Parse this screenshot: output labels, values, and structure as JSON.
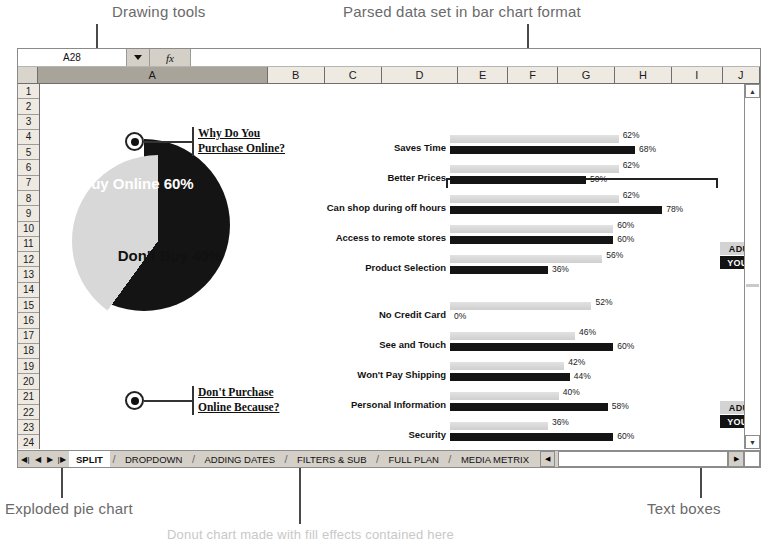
{
  "annotations": {
    "drawing_tools": "Drawing tools",
    "parsed_data": "Parsed data set in bar chart format",
    "exploded_pie": "Exploded pie chart",
    "text_boxes": "Text boxes",
    "bottom_caption": "Donut chart made with fill effects contained here"
  },
  "formula_bar": {
    "name_box_value": "A28",
    "dropdown_icon": "chevron-down-icon",
    "fx_label": "fx",
    "formula_value": ""
  },
  "columns": [
    "A",
    "B",
    "C",
    "D",
    "E",
    "F",
    "G",
    "H",
    "I",
    "J"
  ],
  "selected_column": "A",
  "rows": [
    "1",
    "2",
    "3",
    "4",
    "5",
    "6",
    "7",
    "8",
    "9",
    "10",
    "11",
    "12",
    "13",
    "14",
    "15",
    "16",
    "17",
    "18",
    "19",
    "20",
    "21",
    "22",
    "23",
    "24"
  ],
  "pie": {
    "slices": [
      {
        "label": "Buy Online",
        "value": "60%",
        "pct": 60,
        "color": "#141414",
        "exploded": true
      },
      {
        "label": "Don't Buy",
        "value": "40%",
        "pct": 40,
        "color": "#d8d8d8",
        "exploded": false
      }
    ]
  },
  "callouts": [
    {
      "line1": "Why Do You",
      "line2": "Purchase Online?"
    },
    {
      "line1": "Don't Purchase",
      "line2": "Online Because?"
    }
  ],
  "legend": [
    {
      "label": "ADULT",
      "color": "#d3d3d3"
    },
    {
      "label": "YOUNG",
      "color": "#131313"
    }
  ],
  "chart_data": {
    "type": "bar",
    "title": "",
    "orientation": "horizontal",
    "xlabel": "",
    "ylabel": "",
    "xlim": [
      0,
      100
    ],
    "grid": false,
    "legend_position": "right",
    "groups": [
      {
        "name": "Why Do You Purchase Online?",
        "categories": [
          "Saves Time",
          "Better Prices",
          "Can shop during off hours",
          "Access to remote stores",
          "Product Selection"
        ],
        "series": [
          {
            "name": "ADULT",
            "color": "#d3d3d3",
            "values": [
              62,
              62,
              62,
              60,
              56
            ]
          },
          {
            "name": "YOUNG",
            "color": "#131313",
            "values": [
              68,
              50,
              78,
              60,
              36
            ]
          }
        ]
      },
      {
        "name": "Don't Purchase Online Because?",
        "categories": [
          "No Credit Card",
          "See and Touch",
          "Won't Pay Shipping",
          "Personal Information",
          "Security"
        ],
        "series": [
          {
            "name": "ADULT",
            "color": "#d3d3d3",
            "values": [
              52,
              46,
              42,
              40,
              36
            ]
          },
          {
            "name": "YOUNG",
            "color": "#131313",
            "values": [
              0,
              60,
              44,
              58,
              60
            ]
          }
        ]
      }
    ],
    "labels": {
      "Saves Time": {
        "adult": "62%",
        "young": "68%"
      },
      "Better Prices": {
        "adult": "62%",
        "young": "50%"
      },
      "Can shop during off hours": {
        "adult": "62%",
        "young": "78%"
      },
      "Access to remote stores": {
        "adult": "60%",
        "young": "60%"
      },
      "Product Selection": {
        "adult": "56%",
        "young": "36%"
      },
      "No Credit Card": {
        "adult": "52%",
        "young": "0%"
      },
      "See and Touch": {
        "adult": "46%",
        "young": "60%"
      },
      "Won't Pay Shipping": {
        "adult": "42%",
        "young": "44%"
      },
      "Personal Information": {
        "adult": "40%",
        "young": "58%"
      },
      "Security": {
        "adult": "36%",
        "young": "60%"
      }
    }
  },
  "sheet_tabs": {
    "nav": [
      "first-icon",
      "prev-icon",
      "next-icon",
      "last-icon"
    ],
    "tabs": [
      "SPLIT",
      "DROPDOWN",
      "ADDING DATES",
      "FILTERS & SUB",
      "FULL PLAN",
      "MEDIA METRIX"
    ],
    "active": "SPLIT"
  }
}
